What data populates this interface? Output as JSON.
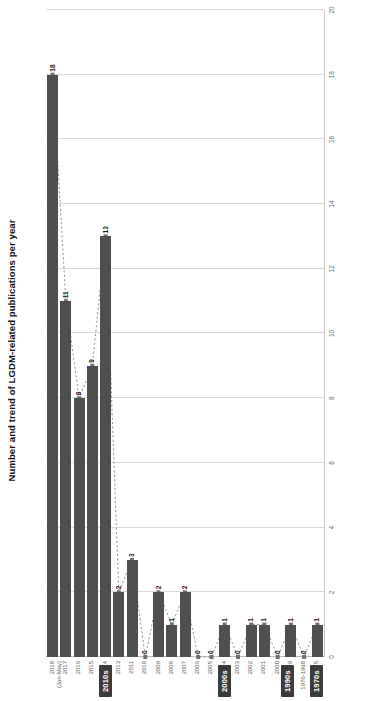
{
  "chart_data": {
    "type": "bar",
    "title": "Number and trend of LGDM-related publications per year",
    "xlabel": "",
    "ylabel": "",
    "orientation": "horizontal-source-rotated",
    "grid": true,
    "legend": "none",
    "value_axis": {
      "min": 0,
      "max": 20,
      "step": 2,
      "ticks": [
        "0",
        "2",
        "4",
        "6",
        "8",
        "10",
        "12",
        "14",
        "16",
        "18",
        "20"
      ]
    },
    "categories": [
      "1975",
      "1976-1998",
      "1999",
      "2000",
      "2001",
      "2002",
      "2003",
      "2004",
      "2005",
      "2006",
      "2007",
      "2008",
      "2009",
      "2010",
      "2011",
      "2013",
      "2014",
      "2015",
      "2016",
      "2017",
      "2018 (Jan-May)"
    ],
    "values": [
      1,
      0,
      1,
      0,
      1,
      1,
      0,
      1,
      0,
      0,
      2,
      1,
      2,
      0,
      3,
      2,
      13,
      9,
      8,
      11,
      18
    ],
    "bar_labels": [
      "1",
      "0",
      "1",
      "0",
      "1",
      "1",
      "0",
      "1",
      "0",
      "0",
      "2",
      "1",
      "2",
      "0",
      "3",
      "2",
      "13",
      "9",
      "8",
      "11",
      "18"
    ],
    "series": [
      {
        "name": "Number of publications",
        "type": "bar",
        "color": "#4f4f4f",
        "values": [
          1,
          0,
          1,
          0,
          1,
          1,
          0,
          1,
          0,
          0,
          2,
          1,
          2,
          0,
          3,
          2,
          13,
          9,
          8,
          11,
          18
        ]
      },
      {
        "name": "Trend",
        "type": "line",
        "style": "dotted",
        "color": "#8a8a8a",
        "marker": "square",
        "values": [
          1,
          0,
          1,
          0,
          1,
          1,
          0,
          1,
          0,
          0,
          2,
          1,
          2,
          0,
          3,
          2,
          13,
          9,
          8,
          11,
          18
        ]
      }
    ],
    "annotations": [
      {
        "label": "1970s",
        "type": "group-badge",
        "category_span": [
          "1975",
          "1975"
        ]
      },
      {
        "label": "…",
        "type": "group-gap"
      },
      {
        "label": "1990s",
        "type": "group-badge",
        "category_span": [
          "1976-1998",
          "1999"
        ]
      },
      {
        "label": "2000s",
        "type": "group-badge",
        "category_span": [
          "2000",
          "2009"
        ]
      },
      {
        "label": "2010s",
        "type": "group-badge",
        "category_span": [
          "2010",
          "2018 (Jan-May)"
        ]
      }
    ]
  },
  "colors": {
    "bar": "#4f4f4f",
    "trend_line": "#8a8a8a",
    "grid": "#d9d9d9",
    "badge_bg": "#3b3b3b",
    "badge_text": "#ffffff",
    "axis_text": "#6b6b6b",
    "title_text": "#111111",
    "background": "#ffffff"
  }
}
